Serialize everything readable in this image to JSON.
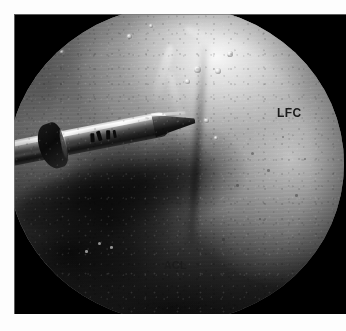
{
  "image": {
    "kind": "arthroscopic-photograph",
    "modality": "knee arthroscopy",
    "frame": {
      "background_color": "#ffffff",
      "border_color": "#000000"
    }
  },
  "annotations": [
    {
      "id": "lfc",
      "text": "LFC",
      "meaning": "lateral femoral condyle",
      "color": "#1a1a1a",
      "position": {
        "x": 269,
        "y": 100
      }
    },
    {
      "id": "acl",
      "text": "ACL",
      "meaning": "anterior cruciate ligament",
      "color": "#1c1c1c",
      "position": {
        "x": 156,
        "y": 253
      }
    }
  ],
  "labels": {
    "lfc": "LFC",
    "acl": "ACL"
  },
  "scene": {
    "instrument": "arthroscopic probe",
    "bright_region": "cartilage surface of lateral femoral condyle",
    "dark_region": "intercondylar notch with anterior cruciate ligament"
  },
  "palette": {
    "frame_black": "#000000",
    "page_white": "#fdfdfd",
    "cartilage_light": "#e8e8e8",
    "tissue_mid": "#8c8c8c",
    "tissue_dark": "#141414",
    "instrument_metal": "#cfcfcf"
  }
}
